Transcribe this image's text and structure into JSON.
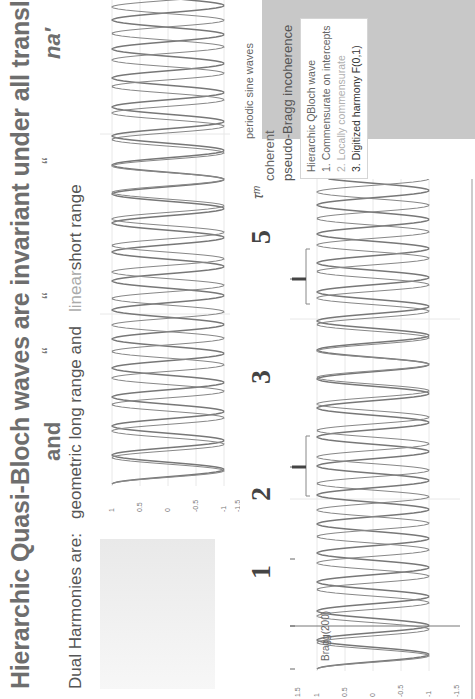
{
  "title": {
    "main": "Hierarchic Quasi-Bloch waves are invariant under all translations",
    "math_1": "a′τᵐ",
    "and": "and",
    "quote_marks": [
      "“",
      "“",
      "“"
    ],
    "math_2": "na′"
  },
  "subtitle": {
    "prefix": "Dual Harmonies are:",
    "geometric": "geometric",
    "long_range": "long range and",
    "linear": "linear",
    "short_range": "short range"
  },
  "markers": [
    "1",
    "2",
    "3",
    "5"
  ],
  "annotations": {
    "bragg": "Bragg(200)",
    "tau_m": "τᵐ",
    "periodic": "periodic sine waves",
    "coherent": "coherent",
    "pseudo_bragg": "pseudo-Bragg incoherence"
  },
  "legend": {
    "title": "Hierarchic QBloch wave",
    "items": [
      {
        "num": "1.",
        "label": "Commensurate on intercepts"
      },
      {
        "num": "2.",
        "label": "Locally commensurate"
      },
      {
        "num": "3.",
        "label": "Digitized harmony  F(0,1)"
      }
    ]
  },
  "colors": {
    "wave": "#777777",
    "grid": "#e4e4e4",
    "legend_bg": "#c8c8c8",
    "title": "#6e6e6e"
  },
  "chart_data": [
    {
      "type": "line",
      "title": "periodic sine waves (geometric long range)",
      "xlabel": "",
      "ylabel": "",
      "ylim": [
        -1,
        1
      ],
      "yticks": [
        "1",
        "0.5",
        "0",
        "-0.5",
        "-1"
      ],
      "grid": true,
      "series": [
        {
          "name": "wave A",
          "description": "sine, amplitude 1, ~17 cycles"
        },
        {
          "name": "wave B",
          "description": "sine, amplitude 1, slightly higher frequency, beating with wave A"
        }
      ]
    },
    {
      "type": "line",
      "title": "Hierarchic QBloch wave (linear short range)",
      "xlabel": "",
      "ylabel": "",
      "ylim": [
        -1.5,
        1.5
      ],
      "yticks": [
        "1.5",
        "1",
        "0.5",
        "0",
        "-0.5",
        "-1",
        "-1.5"
      ],
      "grid": true,
      "series": [
        {
          "name": "wave A",
          "description": "sine, amplitude 1, ~17 cycles"
        },
        {
          "name": "wave B",
          "description": "sine, amplitude 1, beating with wave A"
        }
      ],
      "annotations": [
        "Bragg(200)",
        "1",
        "2",
        "3",
        "5",
        "τᵐ"
      ]
    }
  ]
}
